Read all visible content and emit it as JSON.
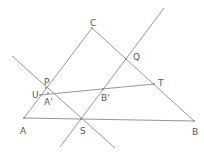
{
  "diagram": {
    "type": "geometry",
    "colors": {
      "line": "#8a8a8a",
      "label": "#555555",
      "background": "#ffffff"
    },
    "points": {
      "A": {
        "label": "A",
        "x": 24,
        "y": 118,
        "lx": 20,
        "ly": 134
      },
      "B": {
        "label": "B",
        "x": 194,
        "y": 121,
        "lx": 192,
        "ly": 135
      },
      "C": {
        "label": "C",
        "x": 92,
        "y": 28,
        "lx": 90,
        "ly": 26
      },
      "S": {
        "label": "S",
        "x": 81,
        "y": 119,
        "lx": 80,
        "ly": 134
      },
      "P": {
        "label": "P",
        "x": 46,
        "y": 88,
        "lx": 44,
        "ly": 85
      },
      "U": {
        "label": "U",
        "x": 40,
        "y": 95,
        "lx": 32,
        "ly": 98
      },
      "A1": {
        "label": "A'",
        "x": 48,
        "y": 93,
        "lx": 44,
        "ly": 105
      },
      "Q": {
        "label": "Q",
        "x": 126,
        "y": 59,
        "lx": 133,
        "ly": 60
      },
      "T": {
        "label": "T",
        "x": 154,
        "y": 84,
        "lx": 158,
        "ly": 86
      },
      "B1": {
        "label": "B'",
        "x": 103,
        "y": 89,
        "lx": 101,
        "ly": 101
      }
    },
    "segments": [
      {
        "name": "side-AC",
        "from": [
          24,
          118
        ],
        "to": [
          92,
          28
        ]
      },
      {
        "name": "side-CB",
        "from": [
          92,
          28
        ],
        "to": [
          194,
          121
        ]
      },
      {
        "name": "side-AB",
        "from": [
          24,
          118
        ],
        "to": [
          194,
          121
        ]
      },
      {
        "name": "line-PS",
        "from": [
          12,
          56
        ],
        "to": [
          115,
          148
        ]
      },
      {
        "name": "line-SQ",
        "from": [
          60,
          147
        ],
        "to": [
          164,
          8
        ]
      },
      {
        "name": "segment-UT",
        "from": [
          40,
          95
        ],
        "to": [
          154,
          84
        ]
      }
    ]
  }
}
